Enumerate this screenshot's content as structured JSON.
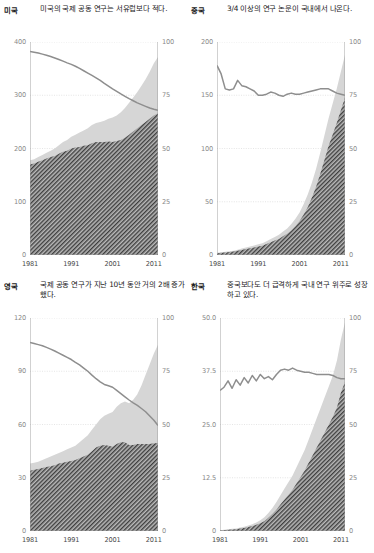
{
  "figure": {
    "panels": [
      {
        "id": "usa",
        "country_label": "미국",
        "description": "미국의 국제 공동 연구는 서유럽보다 적다."
      },
      {
        "id": "china",
        "country_label": "중국",
        "description": "3/4 이상의 연구 논문이 국내에서 나온다."
      },
      {
        "id": "uk",
        "country_label": "영국",
        "description": "국제 공동 연구가 지난 10년 동안 거의 2배 증가했다."
      },
      {
        "id": "korea",
        "country_label": "한국",
        "description": "중국보다도 더 급격하게 국내 연구 위주로 성장하고 있다."
      }
    ],
    "colors": {
      "hatch_fill": "#3f3f3f",
      "hatch_bg": "#b9b9b9",
      "band_fill": "#d6d6d6",
      "line": "#8e8e8e",
      "grid": "#dedede",
      "axis": "#9a9a9a",
      "tick_text": "#8a8a8a",
      "x_tick_text": "#4a4a4a"
    }
  },
  "chart_data": [
    {
      "type": "area",
      "id": "usa",
      "title": "미국",
      "xlabel": "",
      "ylabel": "",
      "x": [
        1981,
        1982,
        1983,
        1984,
        1985,
        1986,
        1987,
        1988,
        1989,
        1990,
        1991,
        1992,
        1993,
        1994,
        1995,
        1996,
        1997,
        1998,
        1999,
        2000,
        2001,
        2002,
        2003,
        2004,
        2005,
        2006,
        2007,
        2008,
        2009,
        2010,
        2011,
        2012
      ],
      "xlim": [
        1981,
        2012
      ],
      "ylim": [
        0,
        400
      ],
      "yticks": [
        0,
        100,
        200,
        300,
        400
      ],
      "ylim_right": [
        0,
        100
      ],
      "yticks_right": [
        0,
        25,
        50,
        75,
        100
      ],
      "xticks": [
        1981,
        1991,
        2001,
        2011
      ],
      "grid": true,
      "legend": "none",
      "series": [
        {
          "name": "total-publications",
          "axis": "left",
          "style": "light-gray-area",
          "values": [
            178,
            180,
            184,
            188,
            192,
            196,
            200,
            206,
            212,
            216,
            222,
            226,
            230,
            234,
            238,
            244,
            248,
            250,
            252,
            256,
            258,
            262,
            268,
            276,
            286,
            296,
            306,
            318,
            330,
            344,
            360,
            372
          ]
        },
        {
          "name": "domestic-only-publications",
          "axis": "left",
          "style": "hatched-area",
          "values": [
            170,
            172,
            175,
            178,
            181,
            184,
            186,
            190,
            194,
            196,
            200,
            202,
            203,
            205,
            206,
            210,
            212,
            212,
            212,
            213,
            212,
            214,
            216,
            220,
            226,
            232,
            238,
            244,
            250,
            256,
            262,
            266
          ]
        },
        {
          "name": "domestic-share-percent",
          "axis": "right",
          "style": "gray-line",
          "values": [
            95.5,
            95.2,
            94.8,
            94.3,
            93.8,
            93.2,
            92.5,
            91.8,
            91.0,
            90.2,
            89.5,
            88.6,
            87.6,
            86.5,
            85.4,
            84.3,
            83.2,
            82.0,
            80.6,
            79.3,
            78.0,
            76.8,
            75.6,
            74.5,
            73.4,
            72.4,
            71.4,
            70.6,
            69.8,
            69.0,
            68.4,
            67.9
          ]
        }
      ]
    },
    {
      "type": "area",
      "id": "china",
      "title": "중국",
      "xlabel": "",
      "ylabel": "",
      "x": [
        1981,
        1982,
        1983,
        1984,
        1985,
        1986,
        1987,
        1988,
        1989,
        1990,
        1991,
        1992,
        1993,
        1994,
        1995,
        1996,
        1997,
        1998,
        1999,
        2000,
        2001,
        2002,
        2003,
        2004,
        2005,
        2006,
        2007,
        2008,
        2009,
        2010,
        2011,
        2012
      ],
      "xlim": [
        1981,
        2012
      ],
      "ylim": [
        0,
        200
      ],
      "yticks": [
        0,
        50,
        100,
        150,
        200
      ],
      "ylim_right": [
        0,
        100
      ],
      "yticks_right": [
        0,
        25,
        50,
        75,
        100
      ],
      "xticks": [
        1981,
        1991,
        2001,
        2011
      ],
      "grid": true,
      "legend": "none",
      "series": [
        {
          "name": "total-publications",
          "axis": "left",
          "style": "light-gray-area",
          "values": [
            2,
            2.5,
            3,
            3.5,
            4,
            5,
            6,
            7,
            8,
            9,
            10,
            11,
            13,
            15,
            17,
            19,
            22,
            25,
            29,
            34,
            40,
            48,
            57,
            68,
            81,
            96,
            112,
            128,
            142,
            156,
            172,
            188
          ]
        },
        {
          "name": "domestic-only-publications",
          "axis": "left",
          "style": "hatched-area",
          "values": [
            1.5,
            2,
            2.4,
            2.8,
            3.2,
            4,
            4.8,
            5.6,
            6.4,
            7,
            8,
            8.8,
            10.4,
            12,
            13.6,
            15,
            17.5,
            20,
            23,
            27,
            32,
            38,
            45,
            54,
            64,
            76,
            89,
            102,
            113,
            124,
            136,
            148
          ]
        },
        {
          "name": "domestic-share-percent",
          "axis": "right",
          "style": "gray-line",
          "values": [
            89,
            85,
            78,
            77.5,
            78,
            82,
            79.5,
            79,
            78,
            77,
            75,
            75,
            75.5,
            76.5,
            76,
            75,
            74.5,
            75.5,
            76,
            75.5,
            75.5,
            76,
            76.5,
            77,
            77.5,
            78,
            78,
            78,
            77,
            76,
            75.5,
            75
          ]
        }
      ]
    },
    {
      "type": "area",
      "id": "uk",
      "title": "영국",
      "xlabel": "",
      "ylabel": "",
      "x": [
        1981,
        1982,
        1983,
        1984,
        1985,
        1986,
        1987,
        1988,
        1989,
        1990,
        1991,
        1992,
        1993,
        1994,
        1995,
        1996,
        1997,
        1998,
        1999,
        2000,
        2001,
        2002,
        2003,
        2004,
        2005,
        2006,
        2007,
        2008,
        2009,
        2010,
        2011,
        2012
      ],
      "xlim": [
        1981,
        2012
      ],
      "ylim": [
        0,
        120
      ],
      "yticks": [
        0,
        30,
        60,
        90,
        120
      ],
      "ylim_right": [
        0,
        100
      ],
      "yticks_right": [
        0,
        25,
        50,
        75,
        100
      ],
      "xticks": [
        1981,
        1991,
        2001,
        2011
      ],
      "grid": true,
      "legend": "none",
      "series": [
        {
          "name": "total-publications",
          "axis": "left",
          "style": "light-gray-area",
          "values": [
            38,
            38.5,
            39,
            40,
            41,
            42,
            43,
            44,
            45,
            46,
            47,
            48,
            50,
            52,
            54,
            57,
            60,
            63,
            65,
            66,
            67,
            70,
            72,
            73,
            72,
            74,
            77,
            82,
            88,
            94,
            100,
            105
          ]
        },
        {
          "name": "domestic-only-publications",
          "axis": "left",
          "style": "hatched-area",
          "values": [
            34,
            34.5,
            35,
            35.5,
            36,
            36.5,
            37,
            38,
            38.5,
            39,
            39.5,
            40,
            41,
            42,
            43,
            45,
            47,
            48,
            48.5,
            48,
            47.5,
            49,
            50,
            50,
            48.5,
            48.5,
            49,
            49,
            49,
            49,
            49.5,
            49.5
          ]
        },
        {
          "name": "domestic-share-percent",
          "axis": "right",
          "style": "gray-line",
          "values": [
            88.5,
            88,
            87.5,
            87,
            86.2,
            85.4,
            84.5,
            83.5,
            82.5,
            81.5,
            80.5,
            79.2,
            78,
            76.5,
            75,
            73.2,
            71.5,
            70,
            68.8,
            68.2,
            67.5,
            66,
            64.5,
            63,
            61.5,
            60.2,
            59,
            57.5,
            56,
            54,
            52,
            49.5
          ]
        }
      ]
    },
    {
      "type": "area",
      "id": "korea",
      "title": "한국",
      "xlabel": "",
      "ylabel": "",
      "x": [
        1981,
        1982,
        1983,
        1984,
        1985,
        1986,
        1987,
        1988,
        1989,
        1990,
        1991,
        1992,
        1993,
        1994,
        1995,
        1996,
        1997,
        1998,
        1999,
        2000,
        2001,
        2002,
        2003,
        2004,
        2005,
        2006,
        2007,
        2008,
        2009,
        2010,
        2011,
        2012
      ],
      "xlim": [
        1981,
        2012
      ],
      "ylim": [
        0,
        50
      ],
      "yticks": [
        0,
        12.5,
        25.0,
        37.5,
        50.0
      ],
      "ytick_labels": [
        "0",
        "12.5",
        "25.0",
        "37.5",
        "50.0"
      ],
      "ylim_right": [
        0,
        100
      ],
      "yticks_right": [
        0,
        25,
        50,
        75,
        100
      ],
      "xticks": [
        1981,
        1991,
        2001,
        2011
      ],
      "grid": true,
      "legend": "none",
      "series": [
        {
          "name": "total-publications",
          "axis": "left",
          "style": "light-gray-area",
          "values": [
            0.2,
            0.3,
            0.4,
            0.5,
            0.6,
            0.8,
            1.0,
            1.3,
            1.6,
            2.0,
            2.5,
            3.2,
            4.2,
            5.4,
            6.8,
            8.4,
            10,
            11.5,
            13,
            15,
            17,
            19,
            21.5,
            24,
            26.5,
            29,
            31.5,
            34,
            36.5,
            40,
            45,
            49
          ]
        },
        {
          "name": "domestic-only-publications",
          "axis": "left",
          "style": "hatched-area",
          "values": [
            0.12,
            0.2,
            0.27,
            0.34,
            0.42,
            0.56,
            0.7,
            0.92,
            1.15,
            1.45,
            1.8,
            2.3,
            3.1,
            4.0,
            5.0,
            6.2,
            7.4,
            8.5,
            9.7,
            11.2,
            12.7,
            14.2,
            16,
            17.8,
            19.6,
            21.4,
            23.2,
            25,
            26.8,
            29,
            32.5,
            35
          ]
        },
        {
          "name": "domestic-share-percent",
          "axis": "right",
          "style": "gray-line",
          "values": [
            66,
            67.5,
            70.5,
            67,
            71,
            68.5,
            72,
            69.5,
            73,
            70.5,
            73.5,
            71.5,
            72.5,
            71,
            73.5,
            75.5,
            76,
            75.5,
            76.5,
            75.5,
            75,
            74.5,
            74.5,
            74,
            73.5,
            73.5,
            73.5,
            73.5,
            73,
            72,
            71.5,
            71.5
          ]
        }
      ]
    }
  ]
}
